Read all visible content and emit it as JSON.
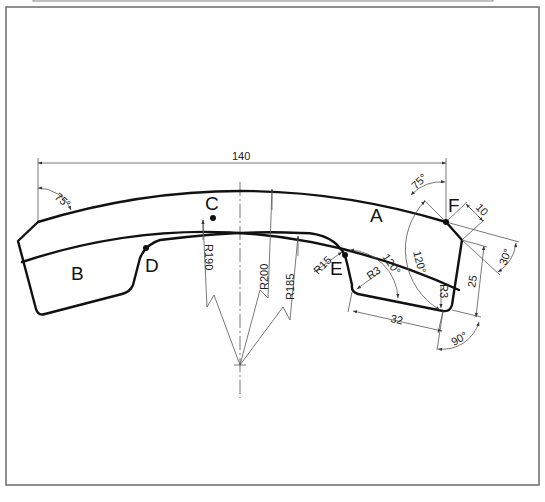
{
  "drawing": {
    "type": "technical-drawing",
    "points": [
      {
        "id": "A",
        "label": "A"
      },
      {
        "id": "B",
        "label": "B"
      },
      {
        "id": "C",
        "label": "C"
      },
      {
        "id": "D",
        "label": "D"
      },
      {
        "id": "E",
        "label": "E"
      },
      {
        "id": "F",
        "label": "F"
      }
    ],
    "dimensions": {
      "width": "140",
      "left_angle": "75°",
      "right_angle": "75°",
      "chamfer": "10",
      "chamfer_angle": "30°",
      "height_right": "25",
      "bottom_length": "32",
      "bottom_angle": "90°",
      "angle_e": "120°",
      "angle_f": "120°",
      "radius_outer": "R200",
      "radius_mid": "R190",
      "radius_inner": "R185",
      "radius_e": "R15",
      "radius_corner_e": "R3",
      "radius_corner_right": "R3"
    }
  }
}
